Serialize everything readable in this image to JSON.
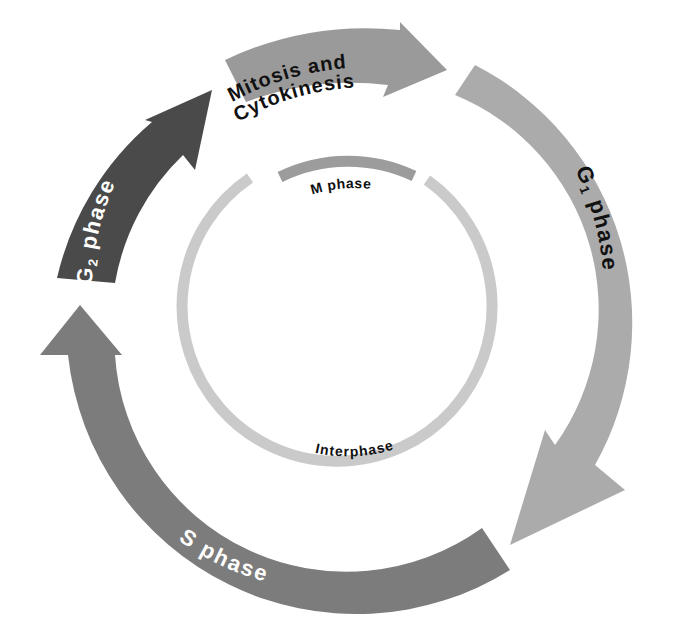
{
  "diagram": {
    "type": "cell-cycle",
    "phases": [
      {
        "id": "mitosis",
        "label_line1": "Mitosis and",
        "label_line2": "Cytokinesis",
        "color": "#9a9a9a",
        "text_color": "#111111"
      },
      {
        "id": "g1",
        "label_prefix": "G",
        "label_sub": "1",
        "label_suffix": " phase",
        "color": "#ababab",
        "text_color": "#111111"
      },
      {
        "id": "s",
        "label": "S phase",
        "color": "#7c7c7c",
        "text_color": "#ffffff"
      },
      {
        "id": "g2",
        "label_prefix": "G",
        "label_sub": "2",
        "label_suffix": " phase",
        "color": "#4a4a4a",
        "text_color": "#ffffff"
      }
    ],
    "inner_ring": {
      "m_phase_label": "M phase",
      "interphase_label": "Interphase",
      "m_phase_color": "#9c9c9c",
      "interphase_color": "#cacaca"
    },
    "background": "#ffffff"
  }
}
